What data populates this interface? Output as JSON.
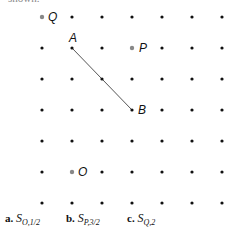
{
  "header": {
    "clipped_text": "shown."
  },
  "grid": {
    "cols": 7,
    "rows": 7,
    "x0": 42,
    "y0": 17,
    "dx": 30,
    "dy": 31,
    "dot_color": "#111111",
    "highlight_color": "#888888"
  },
  "points": [
    {
      "name": "Q",
      "col": 0,
      "row": 0,
      "color": "#888888",
      "label_dx": 6,
      "label_dy": -6
    },
    {
      "name": "A",
      "col": 1,
      "row": 1,
      "color": "#111111",
      "label_dx": -3,
      "label_dy": -16
    },
    {
      "name": "P",
      "col": 3,
      "row": 1,
      "color": "#888888",
      "label_dx": 7,
      "label_dy": -6
    },
    {
      "name": "B",
      "col": 3,
      "row": 3,
      "color": "#111111",
      "label_dx": 6,
      "label_dy": -6
    },
    {
      "name": "O",
      "col": 1,
      "row": 5,
      "color": "#888888",
      "label_dx": 6,
      "label_dy": -6
    }
  ],
  "segment": {
    "from": "A",
    "to": "B",
    "color": "#555555"
  },
  "captions": [
    {
      "letter": "a.",
      "symbol": "S",
      "sub": "O,1/2",
      "x": 5
    },
    {
      "letter": "b.",
      "symbol": "S",
      "sub": "P,3/2",
      "x": 66
    },
    {
      "letter": "c.",
      "symbol": "S",
      "sub": "Q,2",
      "x": 127
    }
  ]
}
